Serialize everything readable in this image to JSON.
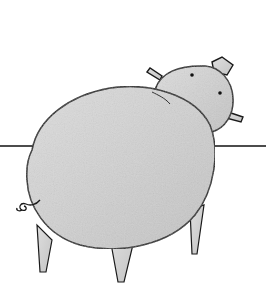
{
  "illustration": {
    "subject": "pig",
    "style": "pencil sketch",
    "colors": {
      "background": "#ffffff",
      "body_fill": "#d4d4d4",
      "outline": "#1a1a1a",
      "horizon": "#111111"
    }
  }
}
